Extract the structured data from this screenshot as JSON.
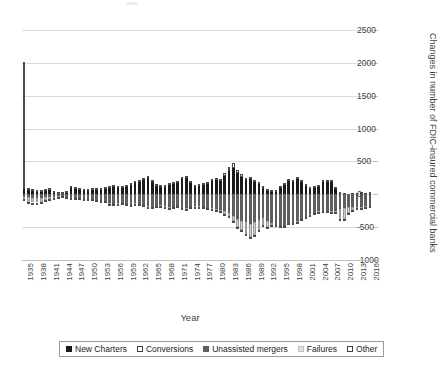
{
  "chart_data": {
    "type": "bar",
    "subtype": "stacked-bar",
    "title": "",
    "xlabel": "Year",
    "ylabel": "Changes in number of FDIC-insured commercial banks",
    "ylim": [
      -1000,
      2500
    ],
    "y_ticks": [
      2500,
      2000,
      1500,
      1000,
      500,
      0,
      -500,
      -1000
    ],
    "y_tick_labels": [
      "2500",
      "2000",
      "1500",
      "1000",
      "500",
      "0",
      "-500",
      "-1000"
    ],
    "grid": true,
    "legend_position": "bottom",
    "x_tick_labels": [
      "1935",
      "1938",
      "1941",
      "1944",
      "1947",
      "1950",
      "1953",
      "1956",
      "1959",
      "1962",
      "1965",
      "1968",
      "1971",
      "1974",
      "1977",
      "1980",
      "1983",
      "1986",
      "1989",
      "1992",
      "1995",
      "1998",
      "2001",
      "2004",
      "2007",
      "2010",
      "2013",
      "2016"
    ],
    "x": [
      1935,
      1936,
      1937,
      1938,
      1939,
      1940,
      1941,
      1942,
      1943,
      1944,
      1945,
      1946,
      1947,
      1948,
      1949,
      1950,
      1951,
      1952,
      1953,
      1954,
      1955,
      1956,
      1957,
      1958,
      1959,
      1960,
      1961,
      1962,
      1963,
      1964,
      1965,
      1966,
      1967,
      1968,
      1969,
      1970,
      1971,
      1972,
      1973,
      1974,
      1975,
      1976,
      1977,
      1978,
      1979,
      1980,
      1981,
      1982,
      1983,
      1984,
      1985,
      1986,
      1987,
      1988,
      1989,
      1990,
      1991,
      1992,
      1993,
      1994,
      1995,
      1996,
      1997,
      1998,
      1999,
      2000,
      2001,
      2002,
      2003,
      2004,
      2005,
      2006,
      2007,
      2008,
      2009,
      2010,
      2011,
      2012,
      2013,
      2014,
      2015,
      2016
    ],
    "series": [
      {
        "name": "New Charters",
        "color": "#1a1a1a",
        "sign": "positive",
        "values": [
          80,
          70,
          60,
          55,
          60,
          70,
          75,
          40,
          25,
          20,
          35,
          100,
          90,
          80,
          70,
          75,
          80,
          85,
          90,
          100,
          110,
          120,
          115,
          110,
          130,
          150,
          180,
          200,
          230,
          250,
          190,
          140,
          120,
          130,
          150,
          160,
          170,
          230,
          250,
          180,
          130,
          140,
          150,
          160,
          200,
          210,
          200,
          280,
          360,
          400,
          320,
          260,
          210,
          230,
          190,
          165,
          105,
          75,
          60,
          50,
          110,
          145,
          200,
          190,
          230,
          190,
          130,
          90,
          110,
          125,
          180,
          190,
          180,
          95,
          30,
          15,
          5,
          20,
          20,
          25,
          20,
          25
        ]
      },
      {
        "name": "Conversions",
        "color": "#ffffff",
        "sign": "positive",
        "values": [
          1930,
          20,
          15,
          12,
          12,
          15,
          15,
          10,
          8,
          8,
          10,
          20,
          18,
          15,
          12,
          12,
          12,
          12,
          12,
          12,
          15,
          15,
          15,
          15,
          15,
          18,
          20,
          22,
          25,
          25,
          20,
          18,
          15,
          18,
          20,
          22,
          25,
          30,
          35,
          25,
          18,
          18,
          20,
          22,
          30,
          35,
          35,
          45,
          60,
          70,
          55,
          45,
          35,
          38,
          30,
          28,
          18,
          12,
          10,
          9,
          18,
          25,
          35,
          32,
          40,
          32,
          22,
          15,
          18,
          22,
          30,
          32,
          30,
          16,
          6,
          3,
          2,
          4,
          4,
          5,
          4,
          5
        ]
      },
      {
        "name": "Unassisted mergers",
        "color": "#5e5e5e",
        "sign": "negative",
        "values": [
          -40,
          -45,
          -50,
          -55,
          -50,
          -45,
          -40,
          -35,
          -30,
          -30,
          -35,
          -50,
          -55,
          -60,
          -65,
          -70,
          -75,
          -85,
          -95,
          -105,
          -140,
          -150,
          -140,
          -135,
          -150,
          -160,
          -140,
          -150,
          -165,
          -180,
          -190,
          -175,
          -170,
          -185,
          -200,
          -190,
          -175,
          -205,
          -215,
          -195,
          -175,
          -180,
          -195,
          -205,
          -215,
          -225,
          -240,
          -260,
          -290,
          -330,
          -375,
          -405,
          -420,
          -450,
          -420,
          -390,
          -360,
          -400,
          -430,
          -460,
          -480,
          -480,
          -430,
          -430,
          -410,
          -380,
          -340,
          -300,
          -280,
          -260,
          -250,
          -260,
          -260,
          -250,
          -230,
          -215,
          -200,
          -195,
          -190,
          -190,
          -185,
          -180
        ]
      },
      {
        "name": "Failures",
        "color": "#cfcfcf",
        "sign": "negative",
        "values": [
          -30,
          -70,
          -75,
          -70,
          -60,
          -45,
          -35,
          -20,
          -5,
          -2,
          -1,
          -1,
          -1,
          -2,
          -4,
          -4,
          -2,
          -3,
          -2,
          -2,
          -4,
          -2,
          -2,
          -4,
          -3,
          -1,
          -5,
          -2,
          -2,
          -7,
          -5,
          -7,
          -4,
          -3,
          -9,
          -7,
          -6,
          -1,
          -6,
          -4,
          -13,
          -16,
          -6,
          -7,
          -10,
          -10,
          -10,
          -42,
          -48,
          -79,
          -120,
          -138,
          -184,
          -200,
          -206,
          -159,
          -108,
          -100,
          -42,
          -11,
          -6,
          -5,
          -1,
          -3,
          -7,
          -2,
          -4,
          -11,
          -3,
          -4,
          0,
          0,
          -3,
          -25,
          -140,
          -157,
          -92,
          -51,
          -24,
          -18,
          -8,
          -5
        ]
      },
      {
        "name": "Other",
        "color": "#ffffff",
        "sign": "negative",
        "values": [
          -25,
          -20,
          -18,
          -15,
          -15,
          -12,
          -12,
          -10,
          -8,
          -8,
          -8,
          -10,
          -10,
          -10,
          -10,
          -10,
          -10,
          -10,
          -12,
          -12,
          -12,
          -12,
          -12,
          -12,
          -12,
          -12,
          -12,
          -12,
          -12,
          -12,
          -12,
          -12,
          -12,
          -12,
          -12,
          -12,
          -12,
          -12,
          -14,
          -14,
          -14,
          -14,
          -14,
          -14,
          -14,
          -15,
          -15,
          -15,
          -18,
          -20,
          -22,
          -25,
          -25,
          -25,
          -25,
          -22,
          -20,
          -20,
          -18,
          -18,
          -18,
          -18,
          -18,
          -18,
          -18,
          -16,
          -16,
          -15,
          -15,
          -15,
          -14,
          -14,
          -14,
          -14,
          -12,
          -12,
          -12,
          -12,
          -12,
          -12,
          -10,
          -10
        ]
      }
    ]
  },
  "legend": {
    "items": [
      {
        "label": "New Charters",
        "swatch": "new-charters"
      },
      {
        "label": "Conversions",
        "swatch": "conversions"
      },
      {
        "label": "Unassisted mergers",
        "swatch": "unassisted"
      },
      {
        "label": "Failures",
        "swatch": "failures"
      },
      {
        "label": "Other",
        "swatch": "other"
      }
    ]
  }
}
